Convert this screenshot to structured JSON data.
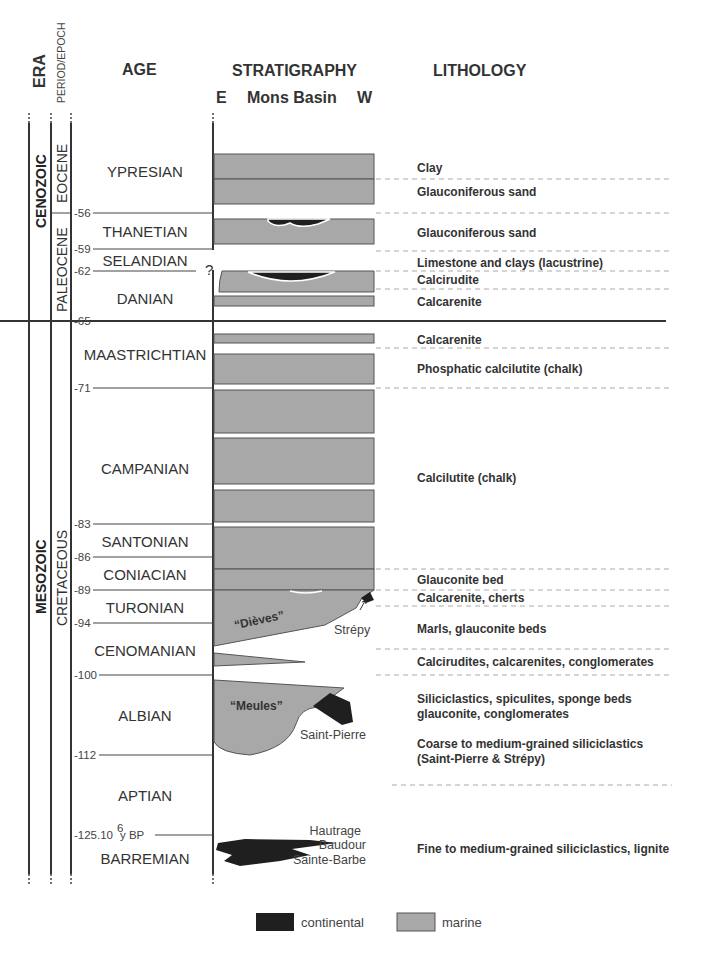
{
  "headers": {
    "era": "ERA",
    "period_epoch": "PERIOD/EPOCH",
    "age": "AGE",
    "stratigraphy": "STRATIGRAPHY",
    "strat_sub_e": "E",
    "strat_sub_basin": "Mons Basin",
    "strat_sub_w": "W",
    "lithology": "LITHOLOGY"
  },
  "eras": [
    {
      "label": "CENOZOIC"
    },
    {
      "label": "MESOZOIC"
    }
  ],
  "periods": [
    {
      "label": "EOCENE"
    },
    {
      "label": "PALEOCENE"
    },
    {
      "label": "CRETACEOUS"
    }
  ],
  "ages": [
    {
      "label": "YPRESIAN"
    },
    {
      "label": "THANETIAN"
    },
    {
      "label": "SELANDIAN"
    },
    {
      "label": "DANIAN"
    },
    {
      "label": "MAASTRICHTIAN"
    },
    {
      "label": "CAMPANIAN"
    },
    {
      "label": "SANTONIAN"
    },
    {
      "label": "CONIACIAN"
    },
    {
      "label": "TURONIAN"
    },
    {
      "label": "CENOMANIAN"
    },
    {
      "label": "ALBIAN"
    },
    {
      "label": "APTIAN"
    },
    {
      "label": "BARREMIAN"
    }
  ],
  "ticks": [
    {
      "label": "-56"
    },
    {
      "label": "-59"
    },
    {
      "label": "-62"
    },
    {
      "label": "-65"
    },
    {
      "label": "-71"
    },
    {
      "label": "-83"
    },
    {
      "label": "-86"
    },
    {
      "label": "-89"
    },
    {
      "label": "-94"
    },
    {
      "label": "-100"
    },
    {
      "label": "-112"
    },
    {
      "label": "-125.10"
    },
    {
      "label": "6"
    },
    {
      "label": " y BP"
    }
  ],
  "uncertain_mark": "?",
  "strat_labels": {
    "dieves": "“Dièves”",
    "meules": "“Meules”",
    "strepy": "Strépy",
    "saint_pierre": "Saint-Pierre",
    "hautrage": "Hautrage",
    "baudour": "Baudour",
    "sainte_barbe": "Sainte-Barbe"
  },
  "lithology": [
    {
      "label": "Clay"
    },
    {
      "label": "Glauconiferous sand"
    },
    {
      "label": "Glauconiferous sand"
    },
    {
      "label": "Limestone and clays (lacustrine)"
    },
    {
      "label": "Calcirudite"
    },
    {
      "label": "Calcarenite"
    },
    {
      "label": "Calcarenite"
    },
    {
      "label": "Phosphatic calcilutite (chalk)"
    },
    {
      "label": "Calcilutite (chalk)"
    },
    {
      "label": "Glauconite bed"
    },
    {
      "label": "Calcarenite, cherts"
    },
    {
      "label": "Marls, glauconite beds"
    },
    {
      "label": "Calcirudites, calcarenites, conglomerates"
    },
    {
      "label": "Siliciclastics, spiculites, sponge beds"
    },
    {
      "label": "glauconite, conglomerates"
    },
    {
      "label": "Coarse to medium-grained siliciclastics"
    },
    {
      "label": "(Saint-Pierre & Strépy)"
    },
    {
      "label": "Fine to medium-grained siliciclastics, lignite"
    }
  ],
  "legend": {
    "continental": "continental",
    "marine": "marine",
    "continental_color": "#1f1f1f",
    "marine_color": "#a8a8a8"
  }
}
